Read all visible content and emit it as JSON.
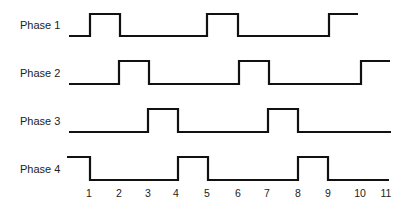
{
  "diagram": {
    "type": "timing-diagram",
    "stroke_color": "#111111",
    "phases": [
      {
        "label": "Phase 1",
        "label_x": 20,
        "label_y": 19,
        "y_high": 14,
        "y_low": 36,
        "x_start": 69,
        "x_end": 358,
        "initial": "low",
        "transitions": [
          90,
          120,
          207,
          238,
          329
        ]
      },
      {
        "label": "Phase 2",
        "label_x": 20,
        "label_y": 67,
        "y_high": 61,
        "y_low": 84,
        "x_start": 69,
        "x_end": 390,
        "initial": "low",
        "transitions": [
          119,
          149,
          239,
          269,
          361
        ]
      },
      {
        "label": "Phase 3",
        "label_x": 20,
        "label_y": 115,
        "y_high": 109,
        "y_low": 132,
        "x_start": 69,
        "x_end": 391,
        "initial": "low",
        "transitions": [
          148,
          178,
          268,
          298
        ]
      },
      {
        "label": "Phase 4",
        "label_x": 20,
        "label_y": 163,
        "y_high": 157,
        "y_low": 180,
        "x_start": 67,
        "x_end": 389,
        "initial": "high",
        "transitions": [
          90,
          178,
          208,
          298,
          328
        ]
      }
    ],
    "ticks": [
      {
        "label": "1",
        "x": 89
      },
      {
        "label": "2",
        "x": 119
      },
      {
        "label": "3",
        "x": 148
      },
      {
        "label": "4",
        "x": 176
      },
      {
        "label": "5",
        "x": 207
      },
      {
        "label": "6",
        "x": 238
      },
      {
        "label": "7",
        "x": 267
      },
      {
        "label": "8",
        "x": 298
      },
      {
        "label": "9",
        "x": 328
      },
      {
        "label": "10",
        "x": 360
      },
      {
        "label": "11",
        "x": 386
      }
    ],
    "tick_y": 187
  }
}
